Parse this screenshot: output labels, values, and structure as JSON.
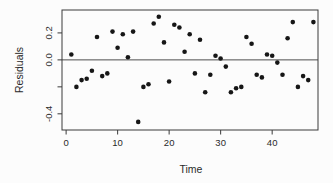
{
  "chart_data": {
    "type": "scatter",
    "title": "",
    "xlabel": "Time",
    "ylabel": "Residuals",
    "x": [
      1,
      2,
      3,
      4,
      5,
      6,
      7,
      8,
      9,
      10,
      11,
      12,
      13,
      14,
      15,
      16,
      17,
      18,
      19,
      20,
      21,
      22,
      23,
      24,
      25,
      26,
      27,
      28,
      29,
      30,
      31,
      32,
      33,
      34,
      35,
      36,
      37,
      38,
      39,
      40,
      41,
      42,
      43,
      44,
      45,
      46,
      47,
      48
    ],
    "y": [
      0.04,
      -0.2,
      -0.15,
      -0.14,
      -0.08,
      0.17,
      -0.12,
      -0.1,
      0.21,
      0.09,
      0.19,
      0.02,
      0.21,
      -0.46,
      -0.2,
      -0.18,
      0.27,
      0.32,
      0.13,
      -0.16,
      0.26,
      0.24,
      0.06,
      0.19,
      -0.1,
      0.15,
      -0.24,
      -0.11,
      0.03,
      0.01,
      -0.05,
      -0.24,
      -0.21,
      -0.2,
      0.17,
      0.12,
      -0.11,
      -0.13,
      0.04,
      0.03,
      -0.02,
      -0.11,
      0.16,
      0.28,
      -0.2,
      -0.12,
      -0.15,
      0.28
    ],
    "xlim": [
      -0.8,
      48.9
    ],
    "ylim": [
      -0.52,
      0.37
    ],
    "x_ticks": [
      0,
      10,
      20,
      30,
      40
    ],
    "x_tick_labels": [
      "0",
      "10",
      "20",
      "30",
      "40"
    ],
    "y_ticks": [
      0.2,
      0.0,
      -0.2,
      -0.4
    ],
    "y_tick_labels": [
      "0.2",
      "0.0",
      "",
      "-0.4"
    ],
    "reference_line_y": 0,
    "grid": false,
    "legend_position": "none",
    "colors": {
      "background": "#fcfcfc",
      "point": "#161616",
      "axis": "#3a3a3a",
      "reference_line": "#4d4d4d",
      "text": "#2a2a2a"
    }
  }
}
